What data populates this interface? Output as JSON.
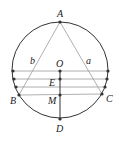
{
  "diagram": {
    "type": "geometry",
    "circle": {
      "cx": 60,
      "cy": 70,
      "r": 48,
      "stroke": "#333333"
    },
    "points": {
      "A": {
        "label": "A",
        "x": 60,
        "y": 22,
        "lx": 57,
        "ly": 17
      },
      "O": {
        "label": "O",
        "x": 60,
        "y": 71,
        "lx": 57,
        "ly": 66
      },
      "E": {
        "label": "E",
        "x": 60,
        "y": 79,
        "lx": 50,
        "ly": 85
      },
      "M": {
        "label": "M",
        "x": 60,
        "y": 95,
        "lx": 49,
        "ly": 103
      },
      "D": {
        "label": "D",
        "x": 60,
        "y": 119,
        "lx": 57,
        "ly": 132
      },
      "B": {
        "label": "B",
        "x": 19,
        "y": 95,
        "lx": 11,
        "ly": 103
      },
      "C": {
        "label": "C",
        "x": 102,
        "y": 94,
        "lx": 105,
        "ly": 101
      }
    },
    "side_labels": {
      "b": {
        "label": "b",
        "x": 31,
        "y": 64
      },
      "a": {
        "label": "a",
        "x": 87,
        "y": 64
      }
    },
    "chords": [
      {
        "y": 71,
        "x1": 13,
        "x2": 108
      },
      {
        "y": 79,
        "x1": 14,
        "x2": 107
      },
      {
        "y": 87,
        "x1": 16,
        "x2": 105
      },
      {
        "y": 95,
        "x1": 19,
        "x2": 102
      }
    ],
    "colors": {
      "line": "#333333",
      "light_line": "#9a9a9a",
      "point": "#333333"
    }
  }
}
